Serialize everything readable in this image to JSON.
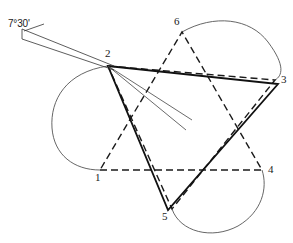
{
  "figure": {
    "background_color": "#ffffff",
    "stroke_color": "#1a1a1a",
    "arc_color": "#555555",
    "thin_line_color": "#444444",
    "width": 293,
    "height": 243,
    "angle_annotation": {
      "label": "7°30'",
      "degrees": 7,
      "minutes": 30,
      "x": 10,
      "y": 21
    },
    "vertices": [
      {
        "id": "1",
        "label": "1",
        "x": 100,
        "y": 170,
        "label_x": 95,
        "label_y": 172
      },
      {
        "id": "2",
        "label": "2",
        "x": 108,
        "y": 66,
        "label_x": 105,
        "label_y": 50
      },
      {
        "id": "3",
        "label": "3",
        "x": 275,
        "y": 80,
        "label_x": 280,
        "label_y": 76
      },
      {
        "id": "4",
        "label": "4",
        "x": 262,
        "y": 170,
        "label_x": 268,
        "label_y": 166
      },
      {
        "id": "5",
        "label": "5",
        "x": 172,
        "y": 209,
        "label_x": 163,
        "label_y": 211
      },
      {
        "id": "6",
        "label": "6",
        "x": 182,
        "y": 32,
        "label_x": 174,
        "label_y": 17
      }
    ],
    "dashed_triangle_a": {
      "name": "triangle-2-3-5",
      "points": "108,66 275,80 172,209"
    },
    "dashed_triangle_b": {
      "name": "triangle-1-4-6",
      "points": "100,170 262,170 182,32"
    },
    "solid_triangle": {
      "name": "rotated-triangle",
      "points": "108,66 278,84 168,210"
    },
    "arcs": [
      {
        "name": "arc-left",
        "d": "M 108,66 A 56,56 0 0 0 100,170"
      },
      {
        "name": "arc-upper-right",
        "d": "M 182,32 A 56,56 0 0 1 275,80"
      },
      {
        "name": "arc-lower",
        "d": "M 172,209 A 56,56 0 0 0 262,170"
      }
    ],
    "pointer": {
      "name": "pointer-wedge",
      "line_upper": "108,66 190,122",
      "line_lower": "108,66 186,130"
    },
    "angle_wedge": {
      "name": "angle-wedge",
      "line_upper": "22,30 112,66",
      "line_lower": "22,38 112,70",
      "cap": "22,30 22,38"
    }
  }
}
